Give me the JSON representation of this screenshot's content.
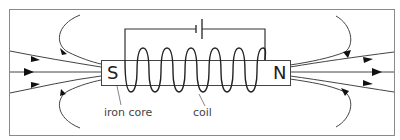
{
  "diagram": {
    "labels": {
      "south_pole": "S",
      "north_pole": "N",
      "iron_core": "iron core",
      "coil": "coil"
    },
    "components": [
      "frame",
      "battery-cell",
      "circuit-wire",
      "iron-core-bar",
      "coil-windings",
      "magnetic-field-lines"
    ],
    "coil_turns": 6,
    "colors": {
      "line": "#333333",
      "frame": "#888888",
      "background": "#ffffff"
    }
  }
}
